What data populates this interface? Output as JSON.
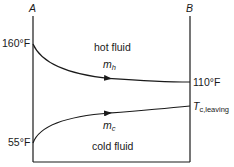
{
  "diagram": {
    "type": "heat-exchanger-temperature-profile",
    "points": {
      "left": "A",
      "right": "B"
    },
    "hot": {
      "label": "hot fluid",
      "flow_symbol": "m",
      "flow_subscript": "h",
      "inlet_temp": "160°F",
      "outlet_temp": "110°F"
    },
    "cold": {
      "label": "cold fluid",
      "flow_symbol": "m",
      "flow_subscript": "c",
      "inlet_temp": "55°F",
      "outlet_symbol": "T",
      "outlet_subscript": "c,leaving"
    },
    "colors": {
      "line": "#1a1a1a",
      "background": "#ffffff"
    }
  }
}
